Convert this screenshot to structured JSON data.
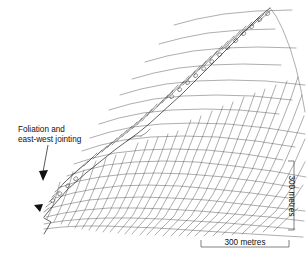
{
  "figure": {
    "type": "geological-cross-section",
    "background_color": "#ffffff",
    "line_color": "#4a4a4a",
    "text_color": "#111111"
  },
  "annotation": {
    "line1": "Foliation and",
    "line2": "east-west jointing",
    "leader_target_count": 2
  },
  "scale_horizontal": {
    "label": "300 metres",
    "orientation": "horizontal"
  },
  "scale_vertical": {
    "label": "300 metres",
    "orientation": "vertical"
  }
}
